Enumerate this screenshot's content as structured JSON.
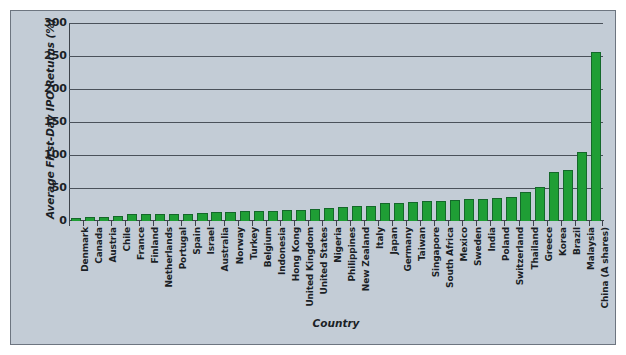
{
  "chart_data": {
    "type": "bar",
    "title": "",
    "xlabel": "Country",
    "ylabel": "Average First-Day IPO Returns (%)",
    "ylim": [
      0,
      300
    ],
    "yticks": [
      0,
      50,
      100,
      150,
      200,
      250,
      300
    ],
    "ytick_labels": [
      "0",
      "50",
      "100",
      "150",
      "200",
      "250",
      "300"
    ],
    "grid": true,
    "legend": "none",
    "bar_color": "#1f9e35",
    "bar_border_color": "#14682a",
    "plot_background": "#c3ccd6",
    "axis_color": "#3d434b",
    "categories": [
      "Denmark",
      "Canada",
      "Austria",
      "Chile",
      "France",
      "Finland",
      "Netherlands",
      "Portugal",
      "Spain",
      "Israel",
      "Australia",
      "Norway",
      "Turkey",
      "Belgium",
      "Indonesia",
      "Hong Kong",
      "United Kingdom",
      "United States",
      "Nigeria",
      "Philippines",
      "New Zealand",
      "Italy",
      "Japan",
      "Germany",
      "Taiwan",
      "Singapore",
      "South Africa",
      "Mexico",
      "Sweden",
      "India",
      "Poland",
      "Switzerland",
      "Thailand",
      "Greece",
      "Korea",
      "Brazil",
      "Malaysia",
      "China (A shares)"
    ],
    "values": [
      5,
      6,
      6.5,
      8,
      10,
      10.5,
      10.5,
      11,
      11,
      12,
      13,
      14,
      14.5,
      15,
      15.5,
      16,
      17,
      17.5,
      19,
      21,
      22,
      23,
      27,
      28,
      29,
      30,
      31,
      32,
      33,
      34,
      35,
      36,
      44,
      52,
      75,
      78,
      105,
      256
    ]
  }
}
